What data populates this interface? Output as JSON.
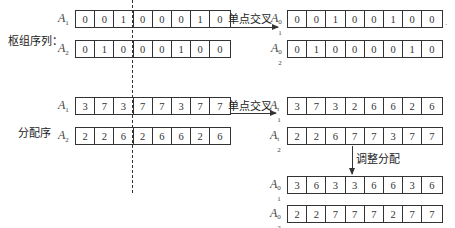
{
  "section1": {
    "label": "枢组序列：",
    "operation": "单点交叉",
    "left": [
      {
        "name": "A",
        "sub": "1",
        "sup": "",
        "cells": [
          "0",
          "0",
          "1",
          "0",
          "0",
          "0",
          "1",
          "0"
        ]
      },
      {
        "name": "A",
        "sub": "2",
        "sup": "",
        "cells": [
          "0",
          "1",
          "0",
          "0",
          "0",
          "1",
          "0",
          "0"
        ]
      }
    ],
    "right": [
      {
        "name": "A",
        "sub": "1",
        "sup": "0",
        "cells": [
          "0",
          "0",
          "1",
          "0",
          "0",
          "1",
          "0",
          "0"
        ]
      },
      {
        "name": "A",
        "sub": "2",
        "sup": "0",
        "cells": [
          "0",
          "1",
          "0",
          "0",
          "0",
          "0",
          "1",
          "0"
        ]
      }
    ]
  },
  "section2": {
    "label": "分配序",
    "operation": "单点交叉",
    "adjust_label": "调整分配",
    "left": [
      {
        "name": "A",
        "sub": "1",
        "sup": "",
        "cells": [
          "3",
          "7",
          "3",
          "7",
          "7",
          "3",
          "7",
          "7"
        ]
      },
      {
        "name": "A",
        "sub": "2",
        "sup": "",
        "cells": [
          "2",
          "2",
          "6",
          "2",
          "6",
          "6",
          "2",
          "6"
        ]
      }
    ],
    "right": [
      {
        "name": "A",
        "sub": "1",
        "sup": "t",
        "cells": [
          "3",
          "7",
          "3",
          "2",
          "6",
          "6",
          "2",
          "6"
        ]
      },
      {
        "name": "A",
        "sub": "2",
        "sup": "t",
        "cells": [
          "2",
          "2",
          "6",
          "7",
          "7",
          "3",
          "7",
          "7"
        ]
      }
    ],
    "adjusted": [
      {
        "name": "A",
        "sub": "1",
        "sup": "0",
        "cells": [
          "3",
          "6",
          "3",
          "3",
          "6",
          "6",
          "3",
          "6"
        ]
      },
      {
        "name": "A",
        "sub": "2",
        "sup": "0",
        "cells": [
          "2",
          "2",
          "7",
          "7",
          "7",
          "2",
          "7",
          "7"
        ]
      }
    ]
  },
  "trailing_mark": "."
}
